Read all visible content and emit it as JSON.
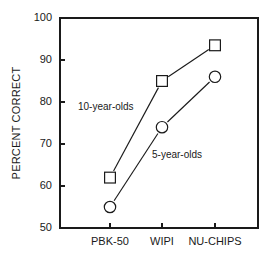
{
  "chart_data": {
    "type": "line",
    "title": "",
    "subtitle": "",
    "xlabel": "",
    "ylabel": "PERCENT CORRECT",
    "categories": [
      "PBK-50",
      "WIPI",
      "NU-CHIPS"
    ],
    "series": [
      {
        "name": "10-year-olds",
        "marker": "square",
        "values": [
          62,
          85,
          93.5
        ]
      },
      {
        "name": "5-year-olds",
        "marker": "circle",
        "values": [
          55,
          74,
          86
        ]
      }
    ],
    "ylim": [
      50,
      100
    ],
    "yticks": [
      50,
      60,
      70,
      80,
      90,
      100
    ],
    "ytick_labels": [
      "50",
      "60",
      "70",
      "80",
      "90",
      "100"
    ],
    "xtick_labels": [
      "PBK-50",
      "WIPI",
      "NU-CHIPS"
    ],
    "grid": false,
    "legend_position": "inline-annotations",
    "annotations": [
      {
        "text": "10-year-olds",
        "x_px": 78,
        "y_px": 110
      },
      {
        "text": "5-year-olds",
        "x_px": 152,
        "y_px": 158
      }
    ],
    "colors": {
      "line": "#1a1a1a",
      "marker_fill": "#ffffff",
      "axis": "#1a1a1a",
      "background": "#ffffff"
    }
  }
}
